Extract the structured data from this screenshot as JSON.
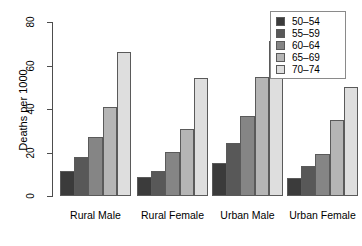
{
  "chart_data": {
    "type": "bar",
    "title": "",
    "subtitle": "",
    "xlabel": "",
    "ylabel": "Deaths per 1000",
    "categories": [
      "Rural Male",
      "Rural Female",
      "Urban Male",
      "Urban Female"
    ],
    "series": [
      {
        "name": "50-54",
        "color": "#3b3b3b",
        "values": [
          11.7,
          8.7,
          15.4,
          8.4
        ]
      },
      {
        "name": "55-59",
        "color": "#585858",
        "values": [
          18.1,
          11.7,
          24.3,
          13.6
        ]
      },
      {
        "name": "60-64",
        "color": "#858585",
        "values": [
          26.9,
          20.3,
          37.0,
          19.3
        ]
      },
      {
        "name": "65-69",
        "color": "#b5b5b5",
        "values": [
          41.0,
          30.9,
          54.6,
          35.1
        ]
      },
      {
        "name": "70-74",
        "color": "#dedede",
        "values": [
          66.0,
          54.3,
          71.1,
          50.0
        ]
      }
    ],
    "ylim": [
      0,
      80
    ],
    "yticks": [
      0,
      20,
      40,
      60,
      80
    ],
    "ytick_labels": [
      "0",
      "20",
      "40",
      "60",
      "80"
    ],
    "grid": false,
    "legend_position": "top-right",
    "legend_entries": [
      "50-54",
      "55-59",
      "60-64",
      "65-69",
      "70-74"
    ]
  },
  "legend": {
    "items": [
      {
        "label": "50–54",
        "color": "#3b3b3b"
      },
      {
        "label": "55–59",
        "color": "#585858"
      },
      {
        "label": "60–64",
        "color": "#858585"
      },
      {
        "label": "65–69",
        "color": "#b5b5b5"
      },
      {
        "label": "70–74",
        "color": "#dedede"
      }
    ]
  },
  "axis": {
    "y_title": "Deaths per 1000",
    "y_labels": [
      "0",
      "20",
      "40",
      "60",
      "80"
    ],
    "x_labels": [
      "Rural Male",
      "Rural Female",
      "Urban Male",
      "Urban Female"
    ]
  }
}
